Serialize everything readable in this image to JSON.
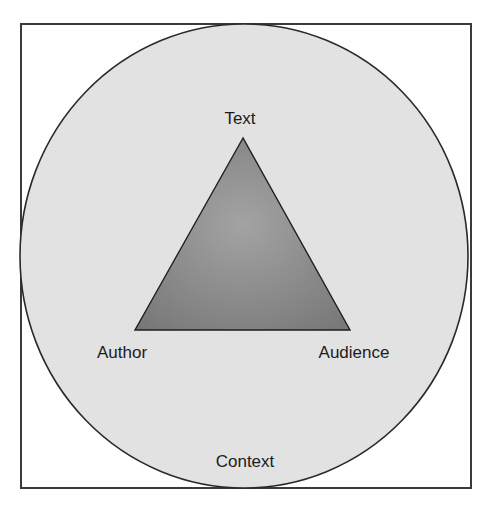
{
  "diagram": {
    "title": "",
    "type": "rhetorical-triangle",
    "frame": {
      "x": 21,
      "y": 24,
      "width": 450,
      "height": 464,
      "stroke": "#3a3a3a"
    },
    "circle": {
      "cx": 244,
      "cy": 256,
      "rx": 224,
      "ry": 232,
      "fill": "#e2e2e2",
      "stroke": "#2a2a2a",
      "label": "Context"
    },
    "triangle": {
      "points": [
        [
          243,
          138
        ],
        [
          135,
          330
        ],
        [
          350,
          330
        ]
      ],
      "fill_light": "#9a9a9a",
      "fill_dark": "#7c7c7c",
      "stroke": "#1e1e1e"
    },
    "nodes": [
      {
        "id": "text",
        "label": "Text",
        "x": 240,
        "y": 118
      },
      {
        "id": "author",
        "label": "Author",
        "x": 122,
        "y": 352
      },
      {
        "id": "audience",
        "label": "Audience",
        "x": 354,
        "y": 352
      },
      {
        "id": "context",
        "label": "Context",
        "x": 245,
        "y": 461
      }
    ]
  }
}
